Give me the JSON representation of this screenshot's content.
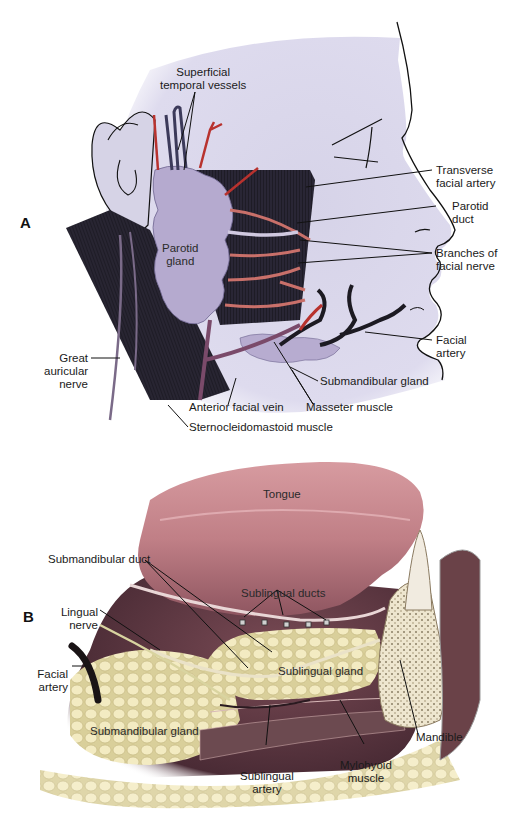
{
  "figure": {
    "panel_a": {
      "letter": "A",
      "labels": {
        "superficial_temporal_vessels": [
          "Superficial",
          "temporal vessels"
        ],
        "transverse_facial_artery": [
          "Transverse",
          "facial artery"
        ],
        "parotid_duct": [
          "Parotid",
          "duct"
        ],
        "branches_facial_nerve": [
          "Branches of",
          "facial nerve"
        ],
        "parotid_gland": [
          "Parotid",
          "gland"
        ],
        "facial_artery": [
          "Facial",
          "artery"
        ],
        "great_auricular_nerve": [
          "Great",
          "auricular",
          "nerve"
        ],
        "submandibular_gland": "Submandibular gland",
        "anterior_facial_vein": "Anterior facial vein",
        "masseter_muscle": "Masseter muscle",
        "sternocleidomastoid_muscle": "Sternocleidomastoid muscle"
      }
    },
    "panel_b": {
      "letter": "B",
      "labels": {
        "tongue": "Tongue",
        "submandibular_duct": "Submandibular duct",
        "sublingual_ducts": "Sublingual ducts",
        "lingual_nerve": [
          "Lingual",
          "nerve"
        ],
        "facial_artery": [
          "Facial",
          "artery"
        ],
        "sublingual_gland": "Sublingual gland",
        "submandibular_gland": "Submandibular gland",
        "mandible": "Mandible",
        "sublingual_artery": [
          "Sublingual",
          "artery"
        ],
        "mylohyoid_muscle": [
          "Mylohyoid",
          "muscle"
        ]
      }
    },
    "colors": {
      "skin": "#dcd9ea",
      "parotid": "#b7acd0",
      "muscle": "#1c1a22",
      "artery": "#b8322e",
      "vein": "#5a5ea8",
      "nerve": "#d9c86a",
      "tongue": "#c98a8e",
      "gland": "#efe3a8",
      "bone": "#efe7d2"
    }
  }
}
